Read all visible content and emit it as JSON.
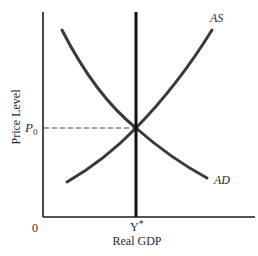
{
  "diagram": {
    "type": "AD-AS equilibrium",
    "axes": {
      "x_label": "Real GDP",
      "y_label": "Price Level",
      "origin_label": "0"
    },
    "curves": {
      "as_label": "AS",
      "ad_label": "AD"
    },
    "equilibrium": {
      "price_label": "P",
      "price_subscript": "0",
      "output_label": "Y",
      "output_superscript": "*"
    },
    "colors": {
      "curve": "#3a3a3a",
      "axis": "#1a1a1a",
      "vertical_line": "#111111",
      "dashed": "#444444"
    }
  }
}
